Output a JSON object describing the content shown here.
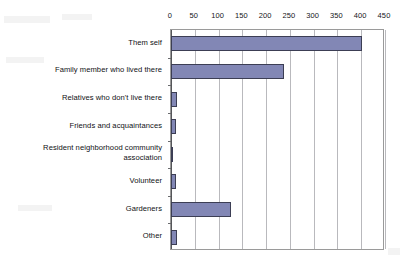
{
  "chart_data": {
    "type": "bar",
    "orientation": "horizontal",
    "title": "",
    "xlabel": "",
    "ylabel": "",
    "xlim": [
      0,
      450
    ],
    "xticks": [
      0,
      50,
      100,
      150,
      200,
      250,
      300,
      350,
      400,
      450
    ],
    "grid": true,
    "legend": "none",
    "bar_color": "#8287b5",
    "bar_edge_color": "#3c3e54",
    "plot_background": "#ffffff",
    "gridline_color": "#b9b9bd",
    "categories": [
      "Them self",
      "Family member who lived there",
      "Relatives who don't live there",
      "Friends and acquaintances",
      "Resident neighborhood community\nassociation",
      "Volunteer",
      "Gardeners",
      "Other"
    ],
    "values": [
      401,
      238,
      12,
      11,
      3,
      11,
      126,
      13
    ]
  }
}
